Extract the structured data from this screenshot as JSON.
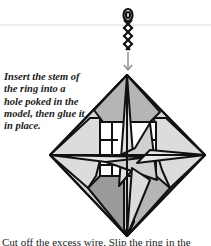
{
  "instruction": {
    "caption": "Insert the stem of the ring into a hole poked in the model, then glue it in place."
  },
  "illustration": {
    "subject": "origami diamond-shaped ornament with twisted wire hanging ring",
    "arrow": "down-arrow",
    "colors": {
      "outline": "#111111",
      "light_gray": "#d6d6d6",
      "mid_gray": "#b5b5b5",
      "dark_gray": "#9a9a9a",
      "white": "#ffffff",
      "arrow": "#8a8a8a"
    }
  },
  "footer": {
    "partial_text": "Cut off the excess wire. Slip the ring in the"
  }
}
